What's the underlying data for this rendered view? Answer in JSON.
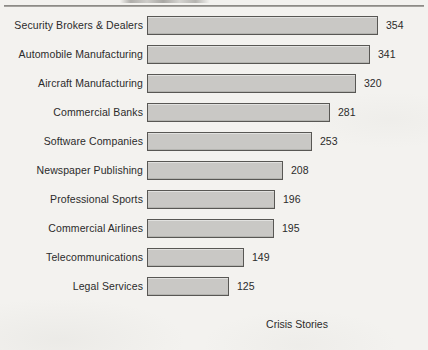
{
  "document": {
    "header_rule": true,
    "clipped_text_above_rule": ""
  },
  "chart_data": {
    "type": "bar",
    "orientation": "horizontal",
    "title": "",
    "subtitle": "",
    "xlabel": "Crisis Stories",
    "ylabel": "",
    "grid": false,
    "legend": false,
    "xlim": [
      0,
      354
    ],
    "value_labels_shown": true,
    "categories": [
      "Security Brokers & Dealers",
      "Automobile Manufacturing",
      "Aircraft Manufacturing",
      "Commercial Banks",
      "Software Companies",
      "Newspaper Publishing",
      "Professional Sports",
      "Commercial Airlines",
      "Telecommunications",
      "Legal Services"
    ],
    "values": [
      354,
      341,
      320,
      281,
      253,
      208,
      196,
      195,
      149,
      125
    ],
    "colors": {
      "bar_fill": "#c9c8c5",
      "bar_border": "#585754",
      "text": "#2b2b2b",
      "background": "#f3f2ef",
      "rule": "#8d8b87"
    }
  }
}
